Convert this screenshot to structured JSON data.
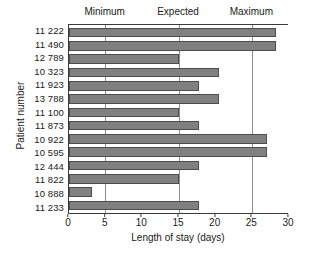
{
  "chart_data": {
    "type": "bar",
    "orientation": "horizontal",
    "title": "",
    "xlabel": "Length of stay (days)",
    "ylabel": "Patient number",
    "xlim": [
      0,
      30
    ],
    "xticks": [
      0,
      5,
      10,
      15,
      20,
      25,
      30
    ],
    "grid": false,
    "categories": [
      "11 222",
      "11 490",
      "12 789",
      "10 323",
      "11 923",
      "13 788",
      "11 100",
      "11 873",
      "10 922",
      "10 595",
      "12 444",
      "11 822",
      "10 888",
      "11 233"
    ],
    "values": [
      28.3,
      28.3,
      15.0,
      20.5,
      17.8,
      20.5,
      15.0,
      17.8,
      27.1,
      27.1,
      17.8,
      15.0,
      3.2,
      17.8
    ],
    "series": [
      {
        "name": "Length of stay",
        "values": [
          28.3,
          28.3,
          15.0,
          20.5,
          17.8,
          20.5,
          15.0,
          17.8,
          27.1,
          27.1,
          17.8,
          15.0,
          3.2,
          17.8
        ]
      }
    ],
    "reference_lines": [
      {
        "label": "Minimum",
        "value": 5
      },
      {
        "label": "Expected",
        "value": 15
      },
      {
        "label": "Maximum",
        "value": 25
      }
    ],
    "legend": [],
    "colors": {
      "bar_fill": "#808080",
      "bar_stroke": "#4d4d4d",
      "axis": "#3a3a3a",
      "reference_line": "#8c8c8c",
      "background": "#ffffff"
    }
  }
}
